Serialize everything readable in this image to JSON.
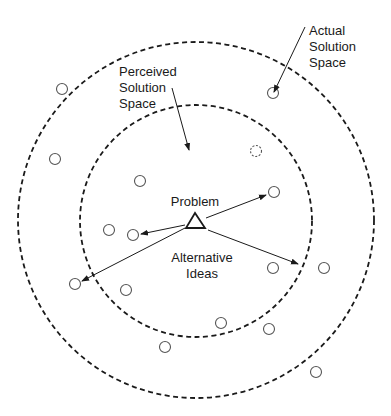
{
  "diagram": {
    "colors": {
      "stroke": "#1a1a1a",
      "idea": "#555555",
      "background": "#ffffff"
    },
    "regions": {
      "actual": {
        "label_lines": [
          "Actual",
          "Solution",
          "Space"
        ],
        "cx": 196,
        "cy": 220,
        "r": 178,
        "style": "dashed"
      },
      "perceived": {
        "label_lines": [
          "Perceived",
          "Solution",
          "Space"
        ],
        "cx": 196,
        "cy": 221,
        "r": 116,
        "style": "dashed"
      }
    },
    "problem": {
      "label": "Problem",
      "shape": "triangle",
      "apex": [
        195,
        213
      ],
      "base_left": [
        186,
        228
      ],
      "base_right": [
        205,
        228
      ]
    },
    "alternatives_label_lines": [
      "Alternative",
      "Ideas"
    ],
    "ideas": [
      {
        "x": 62,
        "y": 89,
        "style": "solid"
      },
      {
        "x": 55,
        "y": 159,
        "style": "solid"
      },
      {
        "x": 140,
        "y": 181,
        "style": "solid"
      },
      {
        "x": 273,
        "y": 93,
        "style": "solid"
      },
      {
        "x": 256,
        "y": 151,
        "style": "dashed"
      },
      {
        "x": 274,
        "y": 192,
        "style": "solid"
      },
      {
        "x": 109,
        "y": 230,
        "style": "solid"
      },
      {
        "x": 133,
        "y": 235,
        "style": "solid"
      },
      {
        "x": 75,
        "y": 284,
        "style": "solid"
      },
      {
        "x": 126,
        "y": 290,
        "style": "solid"
      },
      {
        "x": 273,
        "y": 268,
        "style": "solid"
      },
      {
        "x": 324,
        "y": 268,
        "style": "solid"
      },
      {
        "x": 221,
        "y": 323,
        "style": "solid"
      },
      {
        "x": 269,
        "y": 329,
        "style": "solid"
      },
      {
        "x": 165,
        "y": 347,
        "style": "solid"
      },
      {
        "x": 316,
        "y": 372,
        "style": "solid"
      }
    ],
    "arrows": [
      {
        "from": [
          206,
          218
        ],
        "to": [
          266,
          195
        ],
        "role": "problem-to-idea"
      },
      {
        "from": [
          185,
          225
        ],
        "to": [
          141,
          234
        ],
        "role": "problem-to-idea"
      },
      {
        "from": [
          185,
          228
        ],
        "to": [
          82,
          281
        ],
        "role": "problem-to-idea"
      },
      {
        "from": [
          208,
          230
        ],
        "to": [
          298,
          264
        ],
        "role": "problem-to-idea"
      },
      {
        "from": [
          172,
          88
        ],
        "to": [
          189,
          150
        ],
        "role": "label-pointer-perceived"
      },
      {
        "from": [
          305,
          27
        ],
        "to": [
          274,
          92
        ],
        "role": "label-pointer-actual"
      }
    ]
  }
}
